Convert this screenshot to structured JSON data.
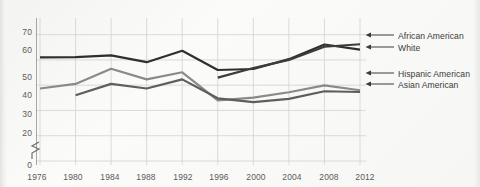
{
  "chart_data": {
    "type": "line",
    "title": "",
    "subtitle": "",
    "xlabel": "",
    "ylabel": "",
    "grid": true,
    "legend_position": "right-inline-arrows",
    "x": [
      1976,
      1980,
      1984,
      1988,
      1992,
      1996,
      2000,
      2004,
      2008,
      2012
    ],
    "xtick_labels": [
      "1976",
      "1980",
      "1984",
      "1988",
      "1992",
      "1996",
      "2000",
      "2004",
      "2008",
      "2012"
    ],
    "ytick_labels": [
      "0",
      "20",
      "30",
      "40",
      "50",
      "60",
      "70"
    ],
    "ytick_values": [
      0,
      20,
      30,
      40,
      50,
      60,
      70
    ],
    "ylim": [
      20,
      75
    ],
    "axis_break": true,
    "axis_break_between": [
      0,
      20
    ],
    "series": [
      {
        "name": "White",
        "color": "#2f2f2f",
        "values": [
          61.0,
          61.1,
          61.8,
          59.1,
          63.6,
          56.0,
          56.4,
          60.3,
          66.1,
          64.1
        ]
      },
      {
        "name": "African American",
        "color": "#3c3c3c",
        "values": [
          null,
          null,
          null,
          null,
          null,
          53.0,
          56.8,
          60.0,
          65.2,
          66.2
        ]
      },
      {
        "name": "Hispanic American",
        "color": "#8a8a8a",
        "values": [
          48.7,
          50.5,
          56.5,
          52.3,
          55.1,
          44.0,
          45.1,
          47.2,
          49.9,
          48.0
        ]
      },
      {
        "name": "Asian American",
        "color": "#5e5e5e",
        "values": [
          null,
          46.0,
          50.5,
          48.7,
          52.3,
          44.8,
          43.3,
          44.6,
          47.6,
          47.3
        ]
      }
    ]
  },
  "legend": {
    "top_group": [
      {
        "label": "African American",
        "arrow": "left-arrow-icon"
      },
      {
        "label": "White",
        "arrow": "left-arrow-icon"
      }
    ],
    "bottom_group": [
      {
        "label": "Hispanic American",
        "arrow": "left-arrow-icon"
      },
      {
        "label": "Asian American",
        "arrow": "left-arrow-icon"
      }
    ]
  },
  "axis": {
    "y_ticks": [
      "70",
      "60",
      "50",
      "40",
      "30",
      "20",
      "0"
    ],
    "x_ticks": [
      "1976",
      "1980",
      "1984",
      "1988",
      "1992",
      "1996",
      "2000",
      "2004",
      "2008",
      "2012"
    ]
  },
  "colors": {
    "grid": "#d2d2d2",
    "axis": "#6f6f6f",
    "dark_line": "#2f2f2f",
    "mid_line": "#5e5e5e",
    "light_line": "#8a8a8a",
    "text": "#4a4a4a",
    "background": "#f7f7f5"
  }
}
